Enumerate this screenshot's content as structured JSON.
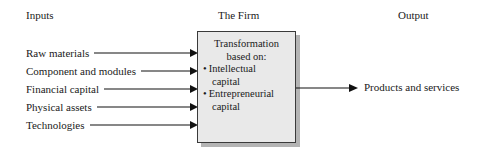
{
  "headers": {
    "inputs": "Inputs",
    "firm": "The Firm",
    "output": "Output"
  },
  "inputs": [
    {
      "label": "Raw materials"
    },
    {
      "label": "Component and modules"
    },
    {
      "label": "Financial capital"
    },
    {
      "label": "Physical assets"
    },
    {
      "label": "Technologies"
    }
  ],
  "firm_box": {
    "title_line1": "Transformation",
    "title_line2": "based on:",
    "bullets": [
      {
        "marker": "•",
        "line1": "Intellectual",
        "line2": "capital"
      },
      {
        "marker": "•",
        "line1": "Entrepreneurial",
        "line2": "capital"
      }
    ]
  },
  "output": {
    "label": "Products and services"
  },
  "colors": {
    "box_fill": "#e9e9e9",
    "box_border": "#3a3a3a",
    "box_shadow": "#b4b4b4",
    "line": "#111111",
    "text": "#1a1a1a",
    "background": "#ffffff"
  }
}
